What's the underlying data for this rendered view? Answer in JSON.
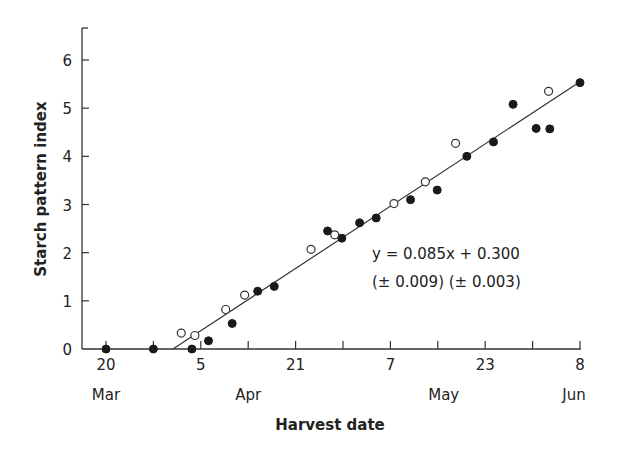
{
  "chart_data": {
    "type": "scatter",
    "title": "",
    "xlabel": "Harvest date",
    "ylabel": "Starch pattern index",
    "ylim": [
      0,
      6.6
    ],
    "xlim_days_from_20_Mar": [
      -4,
      81
    ],
    "grid": false,
    "yticks": [
      0,
      1,
      2,
      3,
      4,
      5,
      6
    ],
    "xticks": [
      {
        "day": 0,
        "label": "20",
        "month": "Mar"
      },
      {
        "day": 8,
        "label": "",
        "month": ""
      },
      {
        "day": 16,
        "label": "5",
        "month": "Apr"
      },
      {
        "day": 24,
        "label": "",
        "month": ""
      },
      {
        "day": 32,
        "label": "21",
        "month": ""
      },
      {
        "day": 40,
        "label": "",
        "month": ""
      },
      {
        "day": 48,
        "label": "7",
        "month": "May"
      },
      {
        "day": 56,
        "label": "",
        "month": ""
      },
      {
        "day": 64,
        "label": "23",
        "month": ""
      },
      {
        "day": 72,
        "label": "",
        "month": ""
      },
      {
        "day": 80,
        "label": "8",
        "month": "Jun"
      }
    ],
    "month_labels": [
      {
        "label": "Mar",
        "day": 0
      },
      {
        "label": "Apr",
        "day": 24
      },
      {
        "label": "May",
        "day": 57
      },
      {
        "label": "Jun",
        "day": 79
      }
    ],
    "series": [
      {
        "name": "filled",
        "marker": "filled-circle",
        "points": [
          {
            "x": 0,
            "y": 0.0
          },
          {
            "x": 8,
            "y": 0.0
          },
          {
            "x": 14.5,
            "y": 0.0
          },
          {
            "x": 17.3,
            "y": 0.17
          },
          {
            "x": 21.3,
            "y": 0.53
          },
          {
            "x": 25.6,
            "y": 1.2
          },
          {
            "x": 28.4,
            "y": 1.3
          },
          {
            "x": 37.4,
            "y": 2.45
          },
          {
            "x": 39.8,
            "y": 2.3
          },
          {
            "x": 42.8,
            "y": 2.62
          },
          {
            "x": 45.6,
            "y": 2.72
          },
          {
            "x": 51.4,
            "y": 3.1
          },
          {
            "x": 55.9,
            "y": 3.3
          },
          {
            "x": 60.9,
            "y": 4.0
          },
          {
            "x": 65.4,
            "y": 4.3
          },
          {
            "x": 68.7,
            "y": 5.08
          },
          {
            "x": 72.6,
            "y": 4.58
          },
          {
            "x": 74.9,
            "y": 4.57
          },
          {
            "x": 80.0,
            "y": 5.53
          }
        ]
      },
      {
        "name": "open",
        "marker": "open-circle",
        "points": [
          {
            "x": 12.7,
            "y": 0.33
          },
          {
            "x": 15.0,
            "y": 0.28
          },
          {
            "x": 20.2,
            "y": 0.82
          },
          {
            "x": 23.4,
            "y": 1.12
          },
          {
            "x": 34.6,
            "y": 2.07
          },
          {
            "x": 38.6,
            "y": 2.37
          },
          {
            "x": 48.6,
            "y": 3.02
          },
          {
            "x": 53.9,
            "y": 3.47
          },
          {
            "x": 59.0,
            "y": 4.27
          },
          {
            "x": 74.7,
            "y": 5.35
          }
        ]
      }
    ],
    "fit_line": {
      "x0": 11.3,
      "y0": 0.0,
      "x1": 80.0,
      "y1": 5.55
    },
    "annotations": [
      {
        "text": "y = 0.085x + 0.300",
        "x": 52,
        "y": 2.0
      },
      {
        "text": "(± 0.009) (± 0.003)",
        "x": 52,
        "y": 1.45
      }
    ]
  },
  "labels": {
    "xlabel": "Harvest date",
    "ylabel": "Starch pattern index",
    "equation": "y = 0.085x + 0.300",
    "errors": "(± 0.009) (± 0.003)"
  }
}
